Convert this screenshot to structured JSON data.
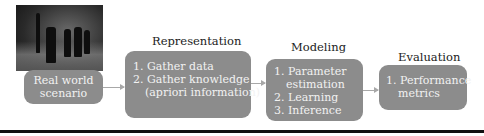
{
  "stages": {
    "real_world": {
      "image": "street-scene-photo",
      "label_line1": "Real world",
      "label_line2": "scenario"
    },
    "representation": {
      "title": "Representation",
      "items": [
        "1. Gather data",
        "2. Gather knowledge",
        "(apriori information)"
      ]
    },
    "modeling": {
      "title": "Modeling",
      "items": [
        "1. Parameter",
        "estimation",
        "2. Learning",
        "3. Inference"
      ]
    },
    "evaluation": {
      "title": "Evaluation",
      "items": [
        "1. Performance",
        "metrics"
      ]
    }
  },
  "colors": {
    "box_fill": "#8c8c8c",
    "box_text": "#f2f2f2",
    "arrow": "#a8a8a8",
    "rule": "#111111"
  }
}
